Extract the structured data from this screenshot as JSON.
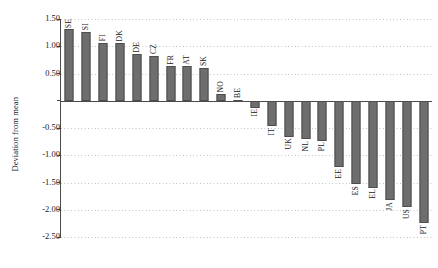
{
  "chart_data": {
    "type": "bar",
    "title": "",
    "xlabel": "",
    "ylabel": "Deviation from mean",
    "ylim": [
      -2.5,
      1.5
    ],
    "ytick_step": 0.5,
    "yticks": [
      "1.50",
      "1.00",
      "0.50",
      "",
      "-0.50",
      "-1.00",
      "-1.50",
      "-2.00",
      "-2.50"
    ],
    "ytick_values": [
      1.5,
      1.0,
      0.5,
      0.0,
      -0.5,
      -1.0,
      -1.5,
      -2.0,
      -2.5
    ],
    "grid": "horizontal-dotted",
    "legend": "none",
    "bar_color": "#6e6e6e",
    "bar_edge_color": "#4d4d4d",
    "categories": [
      "SE",
      "SI",
      "FI",
      "DK",
      "DE",
      "CZ",
      "FR",
      "AT",
      "SK",
      "NO",
      "BE",
      "IE",
      "IT",
      "UK",
      "NL",
      "PL",
      "EE",
      "ES",
      "EL",
      "JA",
      "US",
      "PT"
    ],
    "values": [
      1.31,
      1.27,
      1.06,
      1.06,
      0.85,
      0.83,
      0.64,
      0.63,
      0.61,
      0.13,
      0.02,
      -0.13,
      -0.47,
      -0.66,
      -0.71,
      -0.73,
      -1.22,
      -1.53,
      -1.6,
      -1.83,
      -1.95,
      -2.25
    ],
    "points": [
      {
        "label": "SE",
        "value": 1.31
      },
      {
        "label": "SI",
        "value": 1.27
      },
      {
        "label": "FI",
        "value": 1.06
      },
      {
        "label": "DK",
        "value": 1.06
      },
      {
        "label": "DE",
        "value": 0.85
      },
      {
        "label": "CZ",
        "value": 0.83
      },
      {
        "label": "FR",
        "value": 0.64
      },
      {
        "label": "AT",
        "value": 0.63
      },
      {
        "label": "SK",
        "value": 0.61
      },
      {
        "label": "NO",
        "value": 0.13
      },
      {
        "label": "BE",
        "value": 0.02
      },
      {
        "label": "IE",
        "value": -0.13
      },
      {
        "label": "IT",
        "value": -0.47
      },
      {
        "label": "UK",
        "value": -0.66
      },
      {
        "label": "NL",
        "value": -0.71
      },
      {
        "label": "PL",
        "value": -0.73
      },
      {
        "label": "EE",
        "value": -1.22
      },
      {
        "label": "ES",
        "value": -1.53
      },
      {
        "label": "EL",
        "value": -1.6
      },
      {
        "label": "JA",
        "value": -1.83
      },
      {
        "label": "US",
        "value": -1.95
      },
      {
        "label": "PT",
        "value": -2.25
      }
    ]
  }
}
